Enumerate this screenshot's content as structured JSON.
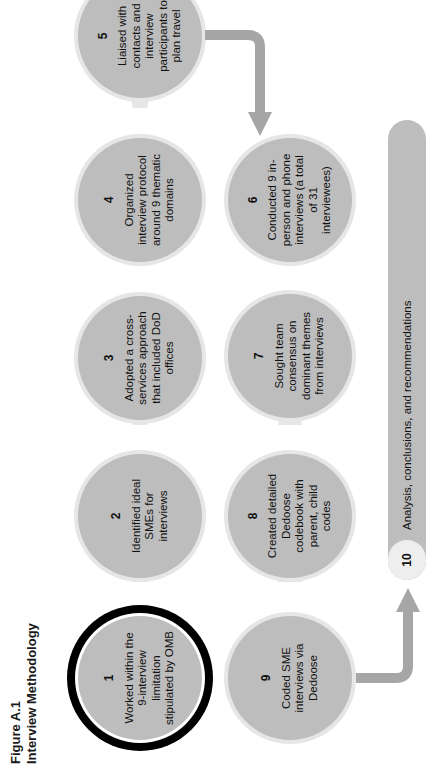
{
  "figure": {
    "label": "Figure A.1",
    "title": "Interview Methodology"
  },
  "steps": [
    {
      "num": "1",
      "text": "Worked within the 9-interview limitation stipulated by OMB",
      "highlighted": true
    },
    {
      "num": "2",
      "text": "Identified ideal SMEs for interviews"
    },
    {
      "num": "3",
      "text": "Adopted a cross-services approach that included DoD offices"
    },
    {
      "num": "4",
      "text": "Organized interview protocol around 9 thematic domains"
    },
    {
      "num": "5",
      "text": "Liaised with contacts and interview participants to plan travel"
    },
    {
      "num": "6",
      "text": "Conducted 9 in-person and phone interviews (a total of 31 interviewees)"
    },
    {
      "num": "7",
      "text": "Sought team consensus on dominant themes from interviews"
    },
    {
      "num": "8",
      "text": "Created detailed Dedoose codebook with parent, child codes"
    },
    {
      "num": "9",
      "text": "Coded SME interviews via Dedoose"
    },
    {
      "num": "10",
      "text": "Analysis, conclusions, and recommendations"
    }
  ],
  "colors": {
    "node_fill": "#bdbdbd",
    "node_halo": "#e6e6e6",
    "highlight_ring": "#000000",
    "arrow": "#a6a6a6"
  },
  "orientation": "rotated 90 degrees counterclockwise"
}
